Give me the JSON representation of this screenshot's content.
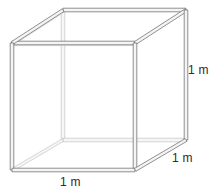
{
  "figure": {
    "background_color": "#ffffff",
    "shape": "cube",
    "edge_style": "double-line beam",
    "visible_edge_color": "#6e6e6e",
    "hidden_edge_color": "#c2c2c2",
    "beam_fill_color": "#f2f2f2",
    "label_color": "#2b2b2b",
    "geometry": {
      "front_face": [
        [
          12,
          43
        ],
        [
          135,
          43
        ],
        [
          135,
          170
        ],
        [
          12,
          170
        ]
      ],
      "back_face": [
        [
          63,
          10
        ],
        [
          186,
          10
        ],
        [
          186,
          140
        ],
        [
          63,
          140
        ]
      ],
      "depth_offset": [
        51,
        -33
      ]
    },
    "labels": {
      "right_edge": "1 m",
      "depth_edge": "1 m",
      "bottom_edge": "1 m"
    }
  }
}
